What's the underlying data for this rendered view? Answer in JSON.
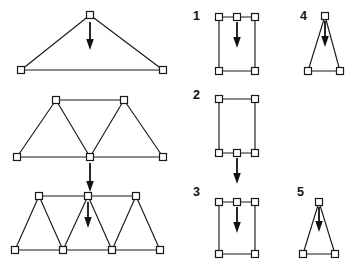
{
  "figure": {
    "background_color": "#ffffff",
    "line_color": "#1a1a1a",
    "load_color": "#111111",
    "joint_fill": "#ffffff",
    "joint_size": 7,
    "width": 347,
    "height": 270
  },
  "left_column": {
    "name": "large-truss-examples",
    "count": 3,
    "trusses": [
      {
        "id": "truss-a",
        "description": "Simple triangular (king post) truss, load at apex",
        "joints": [
          {
            "name": "apex",
            "x": 90,
            "y": 15
          },
          {
            "name": "support-left",
            "x": 21,
            "y": 70
          },
          {
            "name": "support-right",
            "x": 163,
            "y": 70
          }
        ],
        "members": [
          [
            "apex",
            "support-left"
          ],
          [
            "apex",
            "support-right"
          ],
          [
            "support-left",
            "support-right"
          ]
        ],
        "loads": [
          {
            "at": "apex",
            "direction": "down",
            "x": 90,
            "y_start": 22,
            "y_end": 50
          }
        ]
      },
      {
        "id": "truss-b",
        "description": "Two-panel Warren truss, load at bottom mid joint",
        "joints": [
          {
            "name": "top-left",
            "x": 56,
            "y": 100
          },
          {
            "name": "top-right",
            "x": 124,
            "y": 100
          },
          {
            "name": "bottom-left",
            "x": 17,
            "y": 157
          },
          {
            "name": "bottom-mid",
            "x": 90,
            "y": 157
          },
          {
            "name": "bottom-right",
            "x": 163,
            "y": 157
          }
        ],
        "members": [
          [
            "top-left",
            "top-right"
          ],
          [
            "bottom-left",
            "bottom-mid"
          ],
          [
            "bottom-mid",
            "bottom-right"
          ],
          [
            "top-left",
            "bottom-left"
          ],
          [
            "top-left",
            "bottom-mid"
          ],
          [
            "top-right",
            "bottom-mid"
          ],
          [
            "top-right",
            "bottom-right"
          ]
        ],
        "loads": [
          {
            "at": "bottom-mid",
            "direction": "down",
            "x": 90,
            "y_start": 163,
            "y_end": 192
          }
        ]
      },
      {
        "id": "truss-c",
        "description": "Multi-panel Warren truss, load at top mid joint",
        "joints": [
          {
            "name": "top-left",
            "x": 39,
            "y": 196
          },
          {
            "name": "top-mid",
            "x": 88,
            "y": 196
          },
          {
            "name": "top-right",
            "x": 136,
            "y": 196
          },
          {
            "name": "bottom-1",
            "x": 15,
            "y": 250
          },
          {
            "name": "bottom-2",
            "x": 63,
            "y": 250
          },
          {
            "name": "bottom-3",
            "x": 112,
            "y": 250
          },
          {
            "name": "bottom-4",
            "x": 160,
            "y": 250
          }
        ],
        "members": [
          [
            "top-left",
            "top-mid"
          ],
          [
            "top-mid",
            "top-right"
          ],
          [
            "bottom-1",
            "bottom-2"
          ],
          [
            "bottom-2",
            "bottom-3"
          ],
          [
            "bottom-3",
            "bottom-4"
          ],
          [
            "top-left",
            "bottom-1"
          ],
          [
            "top-left",
            "bottom-2"
          ],
          [
            "top-mid",
            "bottom-2"
          ],
          [
            "top-mid",
            "bottom-3"
          ],
          [
            "top-right",
            "bottom-3"
          ],
          [
            "top-right",
            "bottom-4"
          ]
        ],
        "loads": [
          {
            "at": "top-mid",
            "direction": "down",
            "x": 88,
            "y_start": 202,
            "y_end": 228
          }
        ]
      }
    ]
  },
  "right_column": {
    "name": "numbered-load-cases",
    "count": 5,
    "cases": [
      {
        "label": "1",
        "label_x": 193,
        "label_y": 20,
        "id": "case-1",
        "shape": "rectangle-top-mid-node",
        "description": "Rectangular frame, extra node at top centre, load at top centre pointing down",
        "joints": [
          {
            "name": "top-left",
            "x": 219,
            "y": 17
          },
          {
            "name": "top-mid",
            "x": 237,
            "y": 17
          },
          {
            "name": "top-right",
            "x": 255,
            "y": 17
          },
          {
            "name": "bottom-left",
            "x": 219,
            "y": 71
          },
          {
            "name": "bottom-right",
            "x": 255,
            "y": 71
          }
        ],
        "members": [
          [
            "top-left",
            "top-mid"
          ],
          [
            "top-mid",
            "top-right"
          ],
          [
            "top-left",
            "bottom-left"
          ],
          [
            "top-right",
            "bottom-right"
          ],
          [
            "bottom-left",
            "bottom-right"
          ]
        ],
        "loads": [
          {
            "at": "top-mid",
            "direction": "down",
            "x": 237,
            "y_start": 22,
            "y_end": 48
          }
        ]
      },
      {
        "label": "2",
        "label_x": 193,
        "label_y": 99,
        "id": "case-2",
        "shape": "rectangle-bottom-mid-node",
        "description": "Rectangular frame, extra node at bottom centre, load hangs below bottom centre",
        "joints": [
          {
            "name": "top-left",
            "x": 219,
            "y": 99
          },
          {
            "name": "top-right",
            "x": 255,
            "y": 99
          },
          {
            "name": "bottom-left",
            "x": 219,
            "y": 153
          },
          {
            "name": "bottom-mid",
            "x": 237,
            "y": 153
          },
          {
            "name": "bottom-right",
            "x": 255,
            "y": 153
          }
        ],
        "members": [
          [
            "top-left",
            "top-right"
          ],
          [
            "top-left",
            "bottom-left"
          ],
          [
            "top-right",
            "bottom-right"
          ],
          [
            "bottom-left",
            "bottom-mid"
          ],
          [
            "bottom-mid",
            "bottom-right"
          ]
        ],
        "loads": [
          {
            "at": "bottom-mid",
            "direction": "down",
            "x": 237,
            "y_start": 158,
            "y_end": 184
          }
        ]
      },
      {
        "label": "3",
        "label_x": 193,
        "label_y": 196,
        "id": "case-3",
        "shape": "rectangle-top-mid-node",
        "description": "Rectangular frame, extra node at top centre, load at top centre pointing down",
        "joints": [
          {
            "name": "top-left",
            "x": 219,
            "y": 202
          },
          {
            "name": "top-mid",
            "x": 237,
            "y": 202
          },
          {
            "name": "top-right",
            "x": 255,
            "y": 202
          },
          {
            "name": "bottom-left",
            "x": 219,
            "y": 254
          },
          {
            "name": "bottom-right",
            "x": 255,
            "y": 254
          }
        ],
        "members": [
          [
            "top-left",
            "top-mid"
          ],
          [
            "top-mid",
            "top-right"
          ],
          [
            "top-left",
            "bottom-left"
          ],
          [
            "top-right",
            "bottom-right"
          ],
          [
            "bottom-left",
            "bottom-right"
          ]
        ],
        "loads": [
          {
            "at": "top-mid",
            "direction": "down",
            "x": 237,
            "y_start": 207,
            "y_end": 233
          }
        ]
      },
      {
        "label": "4",
        "label_x": 300,
        "label_y": 20,
        "id": "case-4",
        "shape": "narrow-triangle",
        "description": "Tall narrow triangle, load at apex pointing down",
        "joints": [
          {
            "name": "apex",
            "x": 325,
            "y": 16
          },
          {
            "name": "base-left",
            "x": 308,
            "y": 71
          },
          {
            "name": "base-right",
            "x": 340,
            "y": 71
          }
        ],
        "members": [
          [
            "apex",
            "base-left"
          ],
          [
            "apex",
            "base-right"
          ],
          [
            "base-left",
            "base-right"
          ]
        ],
        "loads": [
          {
            "at": "apex",
            "direction": "down",
            "x": 325,
            "y_start": 21,
            "y_end": 47
          }
        ]
      },
      {
        "label": "5",
        "label_x": 297,
        "label_y": 196,
        "id": "case-5",
        "shape": "narrow-triangle",
        "description": "Tall narrow triangle, load at apex pointing down",
        "joints": [
          {
            "name": "apex",
            "x": 319,
            "y": 202
          },
          {
            "name": "base-left",
            "x": 303,
            "y": 254
          },
          {
            "name": "base-right",
            "x": 335,
            "y": 254
          }
        ],
        "members": [
          [
            "apex",
            "base-left"
          ],
          [
            "apex",
            "base-right"
          ],
          [
            "base-left",
            "base-right"
          ]
        ],
        "loads": [
          {
            "at": "apex",
            "direction": "down",
            "x": 319,
            "y_start": 207,
            "y_end": 232
          }
        ]
      }
    ]
  }
}
